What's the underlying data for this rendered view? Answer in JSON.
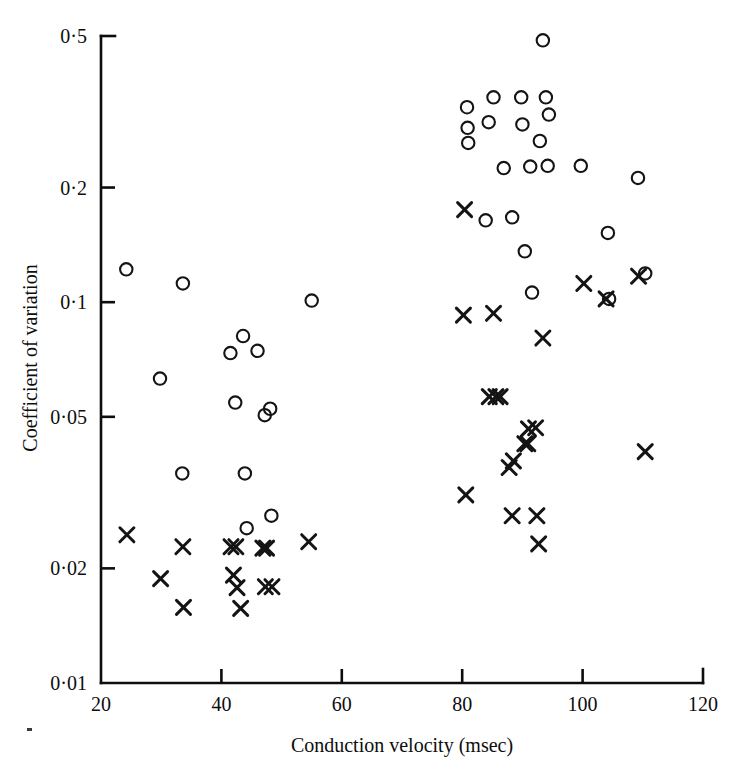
{
  "figure": {
    "background_color": "#ffffff",
    "ink_color": "#141414"
  },
  "chart_data": {
    "type": "scatter",
    "title": "",
    "xlabel": "Conduction velocity (msec)",
    "ylabel": "Coefficient of variation",
    "xscale": "linear",
    "yscale": "log",
    "xlim": [
      20,
      120
    ],
    "ylim": [
      0.01,
      0.5
    ],
    "grid": false,
    "legend_position": "none",
    "xticks": [
      20,
      40,
      60,
      80,
      100,
      120
    ],
    "xtick_labels": [
      "20",
      "40",
      "60",
      "80",
      "100",
      "120"
    ],
    "yticks": [
      0.01,
      0.02,
      0.05,
      0.1,
      0.2,
      0.5
    ],
    "ytick_labels": [
      "0·01",
      "0·02",
      "0·05",
      "0·1",
      "0·2",
      "0·5"
    ],
    "series": [
      {
        "name": "open-circle",
        "marker": "circle",
        "marker_style": "open",
        "points": [
          [
            24.2,
            0.122
          ],
          [
            29.8,
            0.063
          ],
          [
            33.6,
            0.112
          ],
          [
            33.5,
            0.0355
          ],
          [
            41.5,
            0.0735
          ],
          [
            42.3,
            0.0545
          ],
          [
            43.9,
            0.0355
          ],
          [
            43.6,
            0.0815
          ],
          [
            46.0,
            0.0745
          ],
          [
            44.2,
            0.0255
          ],
          [
            47.2,
            0.0505
          ],
          [
            48.1,
            0.0525
          ],
          [
            48.3,
            0.0275
          ],
          [
            55.0,
            0.101
          ],
          [
            80.8,
            0.325
          ],
          [
            80.9,
            0.287
          ],
          [
            81.0,
            0.262
          ],
          [
            83.9,
            0.164
          ],
          [
            84.4,
            0.297
          ],
          [
            85.2,
            0.345
          ],
          [
            86.9,
            0.225
          ],
          [
            88.3,
            0.167
          ],
          [
            89.8,
            0.345
          ],
          [
            90.0,
            0.293
          ],
          [
            90.4,
            0.136
          ],
          [
            91.3,
            0.227
          ],
          [
            91.6,
            0.106
          ],
          [
            92.9,
            0.265
          ],
          [
            93.4,
            0.487
          ],
          [
            93.9,
            0.345
          ],
          [
            94.4,
            0.311
          ],
          [
            94.2,
            0.228
          ],
          [
            99.7,
            0.228
          ],
          [
            104.2,
            0.152
          ],
          [
            104.4,
            0.102
          ],
          [
            109.2,
            0.212
          ],
          [
            110.4,
            0.119
          ]
        ]
      },
      {
        "name": "cross",
        "marker": "x",
        "marker_style": "filled",
        "points": [
          [
            24.3,
            0.0245
          ],
          [
            29.9,
            0.0188
          ],
          [
            33.6,
            0.0228
          ],
          [
            33.7,
            0.0158
          ],
          [
            41.6,
            0.0228
          ],
          [
            42.4,
            0.0228
          ],
          [
            42.0,
            0.0192
          ],
          [
            42.6,
            0.0178
          ],
          [
            43.2,
            0.0157
          ],
          [
            46.9,
            0.0226
          ],
          [
            47.5,
            0.0226
          ],
          [
            47.3,
            0.0179
          ],
          [
            48.4,
            0.0179
          ],
          [
            54.5,
            0.0235
          ],
          [
            80.4,
            0.175
          ],
          [
            80.2,
            0.0925
          ],
          [
            80.6,
            0.0312
          ],
          [
            84.5,
            0.0565
          ],
          [
            85.6,
            0.0565
          ],
          [
            86.3,
            0.0565
          ],
          [
            85.2,
            0.0935
          ],
          [
            87.8,
            0.0368
          ],
          [
            88.5,
            0.0383
          ],
          [
            88.3,
            0.0275
          ],
          [
            90.4,
            0.0425
          ],
          [
            90.9,
            0.0425
          ],
          [
            91.0,
            0.0465
          ],
          [
            92.2,
            0.0468
          ],
          [
            92.4,
            0.0275
          ],
          [
            92.7,
            0.0232
          ],
          [
            93.4,
            0.0805
          ],
          [
            100.2,
            0.112
          ],
          [
            103.9,
            0.102
          ],
          [
            109.3,
            0.117
          ],
          [
            110.4,
            0.0405
          ]
        ]
      }
    ]
  }
}
